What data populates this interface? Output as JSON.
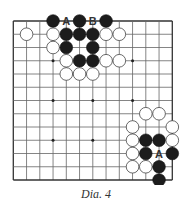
{
  "diagram": {
    "caption": "Dia. 4",
    "board_size": 13,
    "origin": {
      "x": 13.3,
      "y": 21
    },
    "spacing": 13.25,
    "colors": {
      "black": "#1c1c1c",
      "white": "#ffffff",
      "lines": "#666666",
      "edge": "#333333",
      "label": "#333333"
    },
    "hoshi": [
      [
        3,
        3
      ],
      [
        3,
        6
      ],
      [
        3,
        9
      ],
      [
        6,
        3
      ],
      [
        6,
        6
      ],
      [
        6,
        9
      ],
      [
        9,
        3
      ],
      [
        9,
        6
      ],
      [
        9,
        9
      ]
    ],
    "stones": [
      {
        "color": "black",
        "row": 0,
        "col": 3
      },
      {
        "color": "black",
        "row": 0,
        "col": 5
      },
      {
        "color": "black",
        "row": 0,
        "col": 7
      },
      {
        "color": "white",
        "row": 1,
        "col": 1
      },
      {
        "color": "white",
        "row": 1,
        "col": 3
      },
      {
        "color": "black",
        "row": 1,
        "col": 4
      },
      {
        "color": "black",
        "row": 1,
        "col": 5
      },
      {
        "color": "black",
        "row": 1,
        "col": 6
      },
      {
        "color": "white",
        "row": 1,
        "col": 7
      },
      {
        "color": "white",
        "row": 1,
        "col": 8
      },
      {
        "color": "white",
        "row": 2,
        "col": 3
      },
      {
        "color": "black",
        "row": 2,
        "col": 4
      },
      {
        "color": "black",
        "row": 2,
        "col": 6
      },
      {
        "color": "white",
        "row": 3,
        "col": 4
      },
      {
        "color": "black",
        "row": 3,
        "col": 5
      },
      {
        "color": "black",
        "row": 3,
        "col": 6
      },
      {
        "color": "white",
        "row": 3,
        "col": 7
      },
      {
        "color": "white",
        "row": 3,
        "col": 8
      },
      {
        "color": "white",
        "row": 4,
        "col": 4
      },
      {
        "color": "white",
        "row": 4,
        "col": 5
      },
      {
        "color": "white",
        "row": 4,
        "col": 6
      },
      {
        "color": "white",
        "row": 7,
        "col": 10
      },
      {
        "color": "white",
        "row": 7,
        "col": 11
      },
      {
        "color": "white",
        "row": 8,
        "col": 9
      },
      {
        "color": "white",
        "row": 8,
        "col": 12
      },
      {
        "color": "white",
        "row": 9,
        "col": 9
      },
      {
        "color": "black",
        "row": 9,
        "col": 10
      },
      {
        "color": "black",
        "row": 9,
        "col": 11
      },
      {
        "color": "white",
        "row": 9,
        "col": 12
      },
      {
        "color": "white",
        "row": 10,
        "col": 9
      },
      {
        "color": "black",
        "row": 10,
        "col": 10
      },
      {
        "color": "black",
        "row": 10,
        "col": 12
      },
      {
        "color": "white",
        "row": 11,
        "col": 9
      },
      {
        "color": "white",
        "row": 11,
        "col": 10
      },
      {
        "color": "black",
        "row": 11,
        "col": 11
      },
      {
        "color": "black",
        "row": 12,
        "col": 11
      }
    ],
    "labels": [
      {
        "text": "A",
        "row": 0,
        "col": 4
      },
      {
        "text": "B",
        "row": 0,
        "col": 6
      },
      {
        "text": "A",
        "row": 10,
        "col": 11
      }
    ]
  }
}
